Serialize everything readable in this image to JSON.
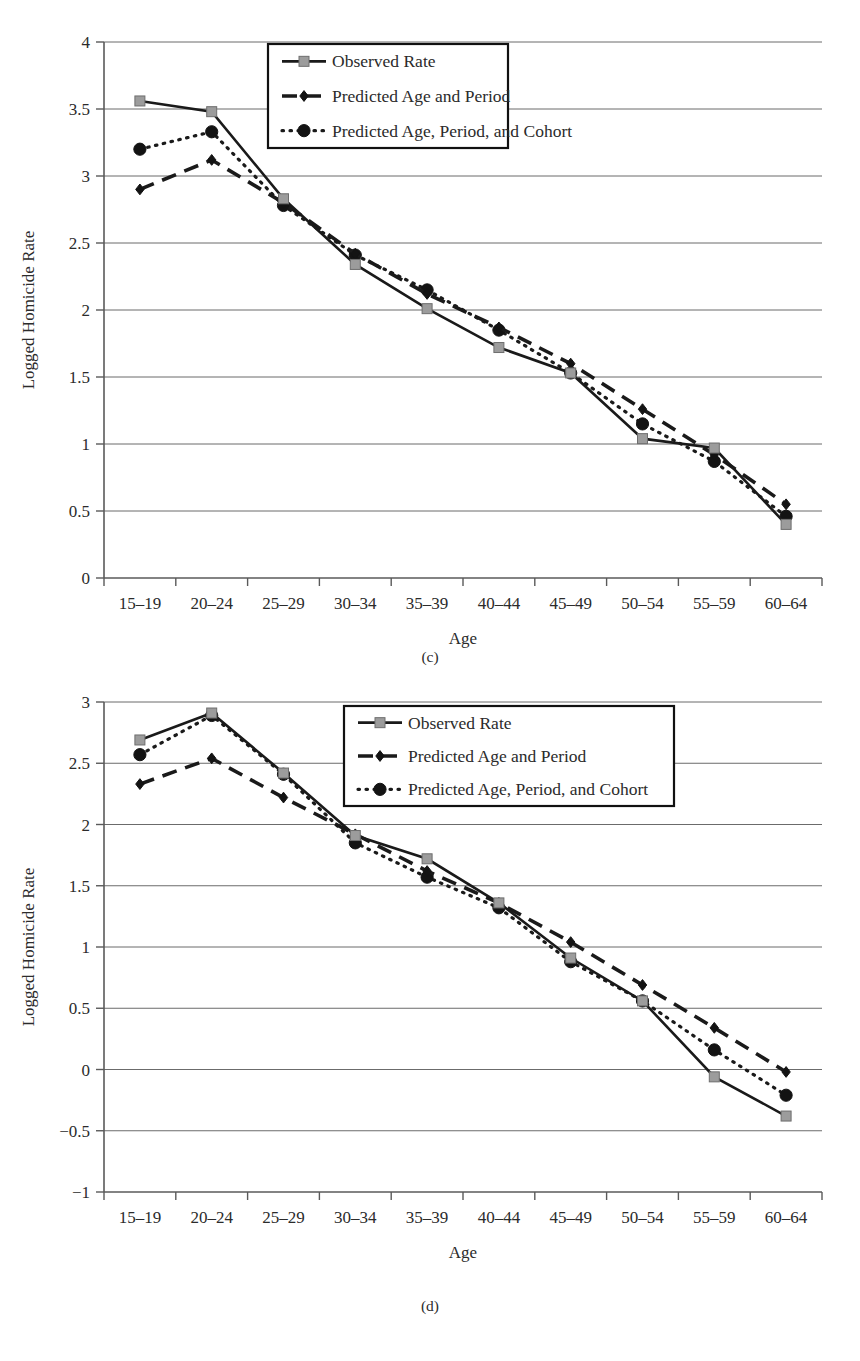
{
  "figure": {
    "panels": [
      {
        "id": "c",
        "caption": "(c)"
      },
      {
        "id": "d",
        "caption": "(d)"
      }
    ]
  },
  "chart_data": [
    {
      "panel": "(c)",
      "type": "line",
      "title": "",
      "xlabel": "Age",
      "ylabel": "Logged Homicide Rate",
      "categories": [
        "15–19",
        "20–24",
        "25–29",
        "30–34",
        "35–39",
        "40–44",
        "45–49",
        "50–54",
        "55–59",
        "60–64"
      ],
      "ylim": [
        0,
        4
      ],
      "yticks": [
        0,
        0.5,
        1,
        1.5,
        2,
        2.5,
        3,
        3.5,
        4
      ],
      "ytick_labels": [
        "0",
        "0.5",
        "1",
        "1.5",
        "2",
        "2.5",
        "3",
        "3.5",
        "4"
      ],
      "grid": true,
      "legend_position": "top-center",
      "series": [
        {
          "name": "Observed Rate",
          "marker": "square",
          "line": "solid",
          "values": [
            3.56,
            3.48,
            2.83,
            2.34,
            2.01,
            1.72,
            1.53,
            1.04,
            0.97,
            0.4
          ]
        },
        {
          "name": "Predicted Age and Period",
          "marker": "diamond",
          "line": "dashed",
          "values": [
            2.9,
            3.12,
            2.8,
            2.42,
            2.12,
            1.87,
            1.6,
            1.26,
            0.92,
            0.55
          ]
        },
        {
          "name": "Predicted Age, Period, and Cohort",
          "marker": "circle",
          "line": "dotted",
          "values": [
            3.2,
            3.33,
            2.78,
            2.41,
            2.15,
            1.85,
            1.53,
            1.15,
            0.87,
            0.46
          ]
        }
      ]
    },
    {
      "panel": "(d)",
      "type": "line",
      "title": "",
      "xlabel": "Age",
      "ylabel": "Logged Homicide Rate",
      "categories": [
        "15–19",
        "20–24",
        "25–29",
        "30–34",
        "35–39",
        "40–44",
        "45–49",
        "50–54",
        "55–59",
        "60–64"
      ],
      "ylim": [
        -1,
        3
      ],
      "yticks": [
        -1,
        -0.5,
        0,
        0.5,
        1,
        1.5,
        2,
        2.5,
        3
      ],
      "ytick_labels": [
        "−1",
        "−0.5",
        "0",
        "0.5",
        "1",
        "1.5",
        "2",
        "2.5",
        "3"
      ],
      "grid": true,
      "legend_position": "top-center",
      "series": [
        {
          "name": "Observed Rate",
          "marker": "square",
          "line": "solid",
          "values": [
            2.69,
            2.91,
            2.42,
            1.91,
            1.72,
            1.36,
            0.91,
            0.56,
            -0.06,
            -0.38
          ]
        },
        {
          "name": "Predicted Age and Period",
          "marker": "diamond",
          "line": "dashed",
          "values": [
            2.33,
            2.54,
            2.22,
            1.92,
            1.62,
            1.36,
            1.04,
            0.69,
            0.34,
            -0.02
          ]
        },
        {
          "name": "Predicted Age, Period, and Cohort",
          "marker": "circle",
          "line": "dotted",
          "values": [
            2.57,
            2.89,
            2.41,
            1.85,
            1.57,
            1.32,
            0.88,
            0.56,
            0.16,
            -0.21
          ]
        }
      ]
    }
  ]
}
